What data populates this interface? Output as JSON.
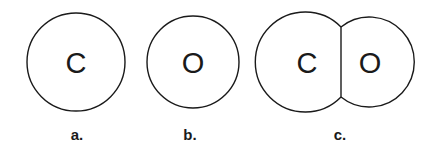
{
  "diagram": {
    "figures": [
      {
        "id": "a",
        "atoms": [
          {
            "symbol": "C"
          }
        ],
        "label": "a."
      },
      {
        "id": "b",
        "atoms": [
          {
            "symbol": "O"
          }
        ],
        "label": "b."
      },
      {
        "id": "c",
        "atoms": [
          {
            "symbol": "C"
          },
          {
            "symbol": "O"
          }
        ],
        "label": "c."
      }
    ]
  }
}
